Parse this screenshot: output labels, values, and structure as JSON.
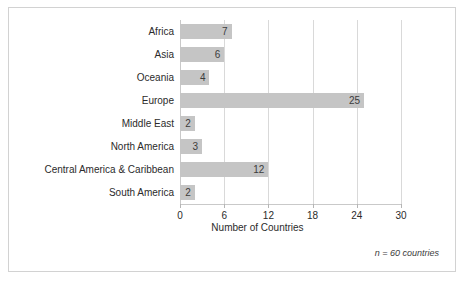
{
  "chart_data": {
    "type": "bar",
    "orientation": "horizontal",
    "title": "",
    "xlabel": "Number of Countries",
    "ylabel": "",
    "xlim": [
      0,
      30
    ],
    "xticks": [
      0,
      6,
      12,
      18,
      24,
      30
    ],
    "xtick_labels": [
      "0",
      "6",
      "12",
      "18",
      "24",
      "30"
    ],
    "grid": true,
    "grid_axis": "x",
    "legend": false,
    "categories": [
      "Africa",
      "Asia",
      "Oceania",
      "Europe",
      "Middle East",
      "North America",
      "Central America & Caribbean",
      "South America"
    ],
    "values": [
      7,
      6,
      4,
      25,
      2,
      3,
      12,
      2
    ],
    "value_labels": [
      "7",
      "6",
      "4",
      "25",
      "2",
      "3",
      "12",
      "2"
    ],
    "annotation": "n = 60 countries",
    "bar_color": "#c5c5c5",
    "grid_color": "#d9d9d9",
    "axis_color": "#c9c9c9",
    "background_color": "#ffffff",
    "border_color": "#d2d2d2",
    "text_color": "#2b2b2b"
  }
}
